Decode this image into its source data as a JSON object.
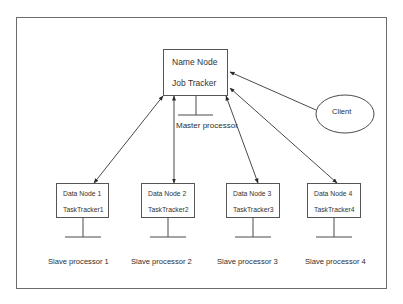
{
  "diagram": {
    "frame": {
      "x": 16,
      "y": 17,
      "w": 371,
      "h": 272
    },
    "colors": {
      "stroke": "#4a4a4a",
      "frame": "#6b6b6b",
      "text": "#2e2e2e",
      "background": "#ffffff"
    },
    "master": {
      "line1": "Name Node",
      "line2": "Job Tracker",
      "label": "Master processor",
      "box": {
        "x": 163,
        "y": 49,
        "w": 65,
        "h": 47
      },
      "stem": {
        "x": 196,
        "y1": 96,
        "y2": 115,
        "baseX1": 178,
        "baseX2": 213
      }
    },
    "client": {
      "label": "Client",
      "ellipse": {
        "cx": 345,
        "cy": 114,
        "rx": 29,
        "ry": 19
      }
    },
    "data_nodes": [
      {
        "line1": "Data Node 1",
        "line2": "TaskTracker1",
        "label": "Slave processor 1",
        "box": {
          "x": 56,
          "y": 183,
          "w": 53,
          "h": 35
        }
      },
      {
        "line1": "Data Node 2",
        "line2": "TaskTracker2",
        "label": "Slave processor 2",
        "box": {
          "x": 141,
          "y": 183,
          "w": 54,
          "h": 35
        }
      },
      {
        "line1": "Data Node 3",
        "line2": "TaskTracker3",
        "label": "Slave processor 3",
        "box": {
          "x": 226,
          "y": 183,
          "w": 54,
          "h": 35
        }
      },
      {
        "line1": "Data Node 4",
        "line2": "TaskTracker4",
        "label": "Slave processor 4",
        "box": {
          "x": 307,
          "y": 183,
          "w": 54,
          "h": 35
        }
      }
    ],
    "edges": [
      {
        "from": "master",
        "to": "data_node_1",
        "x1": 163,
        "y1": 96,
        "x2": 94,
        "y2": 183,
        "bidirectional": true
      },
      {
        "from": "master",
        "to": "data_node_2",
        "x1": 174,
        "y1": 96,
        "x2": 174,
        "y2": 183,
        "bidirectional": true
      },
      {
        "from": "master",
        "to": "data_node_3",
        "x1": 226,
        "y1": 96,
        "x2": 258,
        "y2": 183,
        "bidirectional": true
      },
      {
        "from": "master",
        "to": "data_node_4",
        "x1": 230,
        "y1": 88,
        "x2": 337,
        "y2": 183,
        "bidirectional": true
      },
      {
        "from": "client",
        "to": "master",
        "x1": 316,
        "y1": 110,
        "x2": 230,
        "y2": 72,
        "bidirectional": false
      }
    ]
  }
}
